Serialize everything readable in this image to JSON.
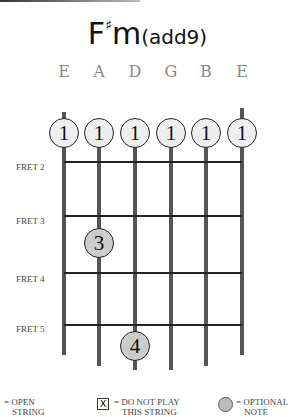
{
  "chord": {
    "root": "F",
    "accidental": "♯",
    "quality": "m",
    "extension": "(add9)"
  },
  "strings": [
    "E",
    "A",
    "D",
    "G",
    "B",
    "E"
  ],
  "fret_labels": [
    "FRET 2",
    "FRET 3",
    "FRET 4",
    "FRET 5"
  ],
  "fingers": {
    "barre": [
      "1",
      "1",
      "1",
      "1",
      "1",
      "1"
    ],
    "a_string": "3",
    "d_string": "4"
  },
  "legend": {
    "open": "= OPEN STRING",
    "open_line1": "= OPEN",
    "open_line2": "STRING",
    "mute_symbol": "X",
    "mute_line1": "= DO NOT PLAY",
    "mute_line2": "THIS STRING",
    "optional_line1": "= OPTIONAL",
    "optional_line2": "NOTE"
  },
  "colors": {
    "finger_fill": "#eeeeee",
    "optional_fill": "#cccccc",
    "string": "#555555",
    "fret": "#222222"
  }
}
